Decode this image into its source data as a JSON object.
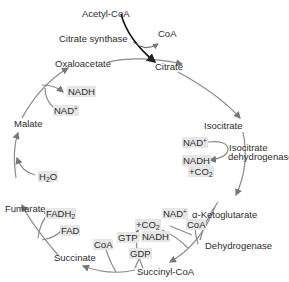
{
  "input": {
    "acetyl_coa": "Acetyl-CoA",
    "enzyme": "Citrate synthase",
    "released_coa": "CoA"
  },
  "metabolites": {
    "oxaloacetate": "Oxaloacetate",
    "citrate": "Citrate",
    "isocitrate": "Isocitrate",
    "alpha_ketoglutarate": "α-Ketoglutarate",
    "succinyl_coa": "Succinyl-CoA",
    "succinate": "Succinate",
    "fumarate": "Fumarate",
    "malate": "Malate"
  },
  "enzymes": {
    "isocitrate_dh_line1": "Isocitrate",
    "isocitrate_dh_line2": "dehydrogenase",
    "akg_dh": "Dehydrogenase"
  },
  "cofactors": {
    "iso_nad": "NAD",
    "iso_nad_sup": "+",
    "iso_nadh": "NADH",
    "iso_co2": "+CO",
    "iso_co2_sub": "2",
    "akg_nad": "NAD",
    "akg_nad_sup": "+",
    "akg_coa": "CoA",
    "akg_co2": "+CO",
    "akg_co2_sub": "2",
    "akg_nadh": "NADH",
    "scs_coa": "CoA",
    "scs_gtp": "GTP",
    "scs_gdp": "GDP",
    "sdh_fadh2": "FADH",
    "sdh_fadh2_sub": "2",
    "sdh_fad": "FAD",
    "fum_h2o": "H",
    "fum_h2o_sub": "2",
    "fum_h2o_o": "O",
    "mdh_nadh": "NADH",
    "mdh_nad": "NAD",
    "mdh_nad_sup": "+"
  },
  "colors": {
    "cycle_arrow": "#8a8a8a",
    "input_arrow": "#111111",
    "cofactor_bg": "#e6e6e6",
    "text": "#2b2b2b"
  }
}
